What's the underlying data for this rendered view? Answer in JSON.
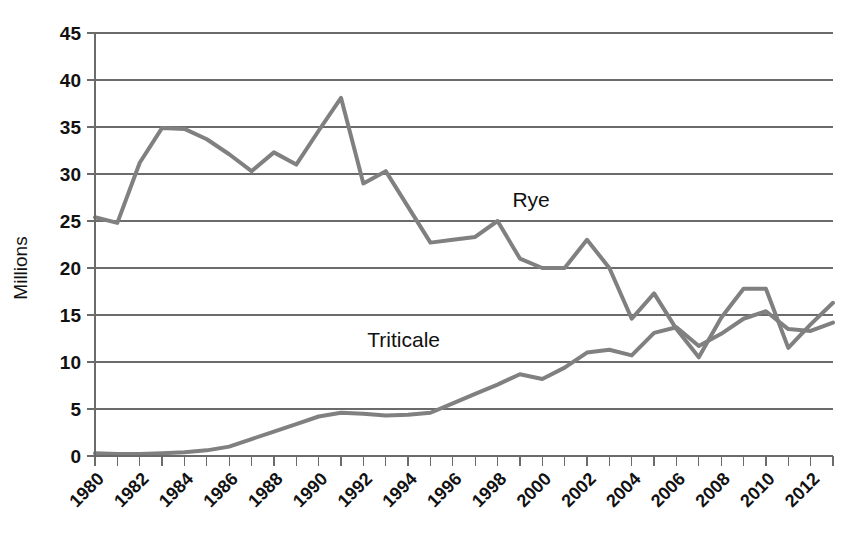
{
  "chart_data": {
    "type": "line",
    "title": "",
    "xlabel": "",
    "ylabel": "Millions",
    "ylim": [
      0,
      45
    ],
    "ytick_step": 5,
    "yticks": [
      0,
      5,
      10,
      15,
      20,
      25,
      30,
      35,
      40,
      45
    ],
    "xlim": [
      1980,
      2013
    ],
    "x": [
      1980,
      1981,
      1982,
      1983,
      1984,
      1985,
      1986,
      1987,
      1988,
      1989,
      1990,
      1991,
      1992,
      1993,
      1994,
      1995,
      1996,
      1997,
      1998,
      1999,
      2000,
      2001,
      2002,
      2003,
      2004,
      2005,
      2006,
      2007,
      2008,
      2009,
      2010,
      2011,
      2012,
      2013
    ],
    "xtick_labels": [
      "1980",
      "",
      "1982",
      "",
      "1984",
      "",
      "1986",
      "",
      "1988",
      "",
      "1990",
      "",
      "1992",
      "",
      "1994",
      "",
      "1996",
      "",
      "1998",
      "",
      "2000",
      "",
      "2002",
      "",
      "2004",
      "",
      "2006",
      "",
      "2008",
      "",
      "2010",
      "",
      "2012",
      ""
    ],
    "xtick_labels_visible": [
      "1980",
      "1982",
      "1984",
      "1986",
      "1988",
      "1990",
      "1992",
      "1994",
      "1996",
      "1998",
      "2000",
      "2002",
      "2004",
      "2006",
      "2008",
      "2010",
      "2012"
    ],
    "grid": "horizontal",
    "legend_position": "inline-annotation",
    "series": [
      {
        "name": "Rye",
        "color": "#808080",
        "label_x": 1999.5,
        "label_y": 26.5,
        "values": [
          25.4,
          24.8,
          31.2,
          34.9,
          34.8,
          33.7,
          32.1,
          30.3,
          32.3,
          31.0,
          34.6,
          38.1,
          29.0,
          30.3,
          26.5,
          22.7,
          23.0,
          23.3,
          25.0,
          21.0,
          20.0,
          20.0,
          23.0,
          20.0,
          14.6,
          17.3,
          13.5,
          10.5,
          14.7,
          17.8,
          17.8,
          11.5,
          14.0,
          16.3
        ]
      },
      {
        "name": "Triticale",
        "color": "#808080",
        "label_x": 1993.8,
        "label_y": 11.6,
        "values": [
          0.3,
          0.2,
          0.2,
          0.3,
          0.4,
          0.6,
          1.0,
          1.8,
          2.6,
          3.4,
          4.2,
          4.6,
          4.5,
          4.3,
          4.4,
          4.6,
          5.6,
          6.6,
          7.6,
          8.7,
          8.2,
          9.4,
          11.0,
          11.3,
          10.7,
          13.1,
          13.7,
          11.7,
          13.0,
          14.6,
          15.4,
          13.5,
          13.3,
          14.2
        ]
      }
    ]
  },
  "axis": {
    "y_title": "Millions"
  },
  "annotations": {
    "rye_label": "Rye",
    "triticale_label": "Triticale"
  },
  "colors": {
    "line": "#808080",
    "grid": "#6b6b6b",
    "text": "#111111",
    "background": "#ffffff"
  }
}
